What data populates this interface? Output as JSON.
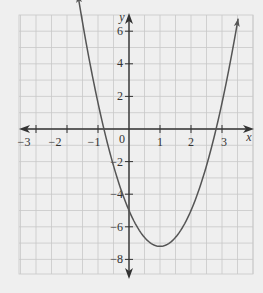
{
  "chart_data": {
    "type": "line",
    "title": "",
    "xlabel": "x",
    "ylabel": "y",
    "xlim": [
      -3.5,
      3.8
    ],
    "ylim": [
      -9,
      7
    ],
    "grid": true,
    "x_ticks": [
      -3,
      -2,
      -1,
      1,
      2,
      3
    ],
    "x_tick_labels": [
      "−3",
      "−2",
      "−1",
      "1",
      "2",
      "3"
    ],
    "y_ticks": [
      6,
      4,
      2,
      -2,
      -4,
      -6,
      -8
    ],
    "y_tick_labels": [
      "6",
      "4",
      "2",
      "−2",
      "−4",
      "−6",
      "−8"
    ],
    "origin_label": "0",
    "series": [
      {
        "name": "parabola",
        "equation_estimate": "y = 2.2x^2 - 4.4x - 5",
        "vertex": [
          1,
          -7.2
        ],
        "x_intercepts": [
          -0.8,
          2.8
        ],
        "y_intercept": -5,
        "x": [
          -1.65,
          -1,
          -0.5,
          0,
          0.5,
          1,
          1.5,
          2,
          2.5,
          3,
          3.5
        ],
        "y": [
          6.9,
          1.6,
          -2.2,
          -5,
          -6.7,
          -7.2,
          -6.7,
          -5,
          -2.2,
          1.6,
          6.4
        ]
      }
    ]
  },
  "labels": {
    "x_axis": "x",
    "y_axis": "y",
    "origin": "0",
    "xt": [
      "−3",
      "−2",
      "−1",
      "1",
      "2",
      "3"
    ],
    "yt": [
      "6",
      "4",
      "2",
      "−2",
      "−4",
      "−6",
      "−8"
    ]
  },
  "colors": {
    "background": "#efefef",
    "grid": "#c8c8c8",
    "axis": "#333333",
    "curve": "#555555"
  }
}
